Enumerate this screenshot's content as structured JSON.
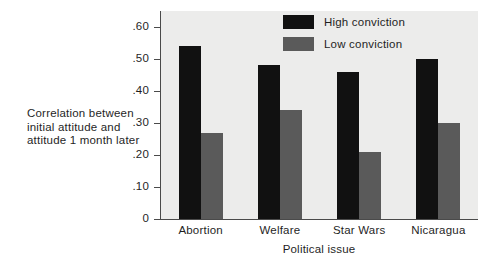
{
  "chart_data": {
    "type": "bar",
    "title": "",
    "subtitle": "",
    "xlabel": "Political issue",
    "ylabel": "Correlation between initial attitude and attitude 1 month later",
    "ylabel_lines": [
      "Correlation between",
      "initial attitude and",
      "attitude 1 month later"
    ],
    "categories": [
      "Abortion",
      "Welfare",
      "Star Wars",
      "Nicaragua"
    ],
    "series": [
      {
        "name": "High conviction",
        "color": "#111111",
        "values": [
          0.54,
          0.48,
          0.46,
          0.5
        ]
      },
      {
        "name": "Low conviction",
        "color": "#5a5a5a",
        "values": [
          0.27,
          0.34,
          0.21,
          0.3
        ]
      }
    ],
    "ylim": [
      0,
      0.65
    ],
    "yticks": [
      0,
      0.1,
      0.2,
      0.3,
      0.4,
      0.5,
      0.6
    ],
    "ytick_labels": [
      "0",
      ".10",
      ".20",
      ".30",
      ".40",
      ".50",
      ".60"
    ],
    "grid": false,
    "legend_position": "top-right",
    "plot_background": "#ececeb",
    "figure_background": "#ffffff",
    "axis_color": "#4a4a4a"
  },
  "legend": {
    "items": [
      {
        "label": "High conviction",
        "swatch": "high"
      },
      {
        "label": "Low conviction",
        "swatch": "low"
      }
    ]
  }
}
